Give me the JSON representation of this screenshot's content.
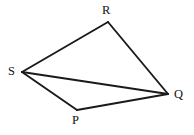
{
  "figure": {
    "kind": "geometry-diagram",
    "caption": "",
    "background_color": "#ffffff",
    "stroke_color": "#1a1a1a",
    "label_color": "#111111",
    "width": 194,
    "height": 135,
    "shape_name": "PQRS",
    "vertices": [
      {
        "id": "R",
        "label": "R",
        "x": 108,
        "y": 22,
        "label_x": 102,
        "label_y": 4
      },
      {
        "id": "S",
        "label": "S",
        "x": 22,
        "y": 72,
        "label_x": 8,
        "label_y": 65
      },
      {
        "id": "Q",
        "label": "Q",
        "x": 168,
        "y": 94,
        "label_x": 174,
        "label_y": 88
      },
      {
        "id": "P",
        "label": "P",
        "x": 77,
        "y": 110,
        "label_x": 72,
        "label_y": 114
      }
    ],
    "edges": [
      {
        "id": "SR",
        "from": "S",
        "to": "R",
        "type": "side"
      },
      {
        "id": "RQ",
        "from": "R",
        "to": "Q",
        "type": "side"
      },
      {
        "id": "QP",
        "from": "Q",
        "to": "P",
        "type": "side"
      },
      {
        "id": "PS",
        "from": "P",
        "to": "S",
        "type": "side"
      },
      {
        "id": "SQ",
        "from": "S",
        "to": "Q",
        "type": "diagonal"
      }
    ]
  }
}
